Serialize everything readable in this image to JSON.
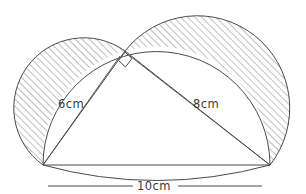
{
  "figure": {
    "type": "geometry-diagram",
    "canvas": {
      "width": 306,
      "height": 194,
      "background": "#ffffff"
    },
    "style": {
      "stroke": "#4a4a4a",
      "hatch_color": "#7a7a7a",
      "hatch_angle_deg": 45,
      "hatch_spacing_px": 5,
      "stroke_width": 1
    },
    "vertices": {
      "A": {
        "name": "bottom-left-vertex",
        "x": 43,
        "y": 165
      },
      "B": {
        "name": "bottom-right-vertex",
        "x": 270,
        "y": 165
      },
      "C": {
        "name": "apex-right-angle-vertex",
        "x": 125,
        "y": 51
      }
    },
    "right_angle_marker": {
      "at": "C",
      "size_px": 11,
      "name": "right-angle-square"
    },
    "labels": {
      "leg_a": {
        "text": "6cm",
        "x": 58,
        "y": 104,
        "rotation": 0
      },
      "leg_b": {
        "text": "8cm",
        "x": 193,
        "y": 104,
        "rotation": 0
      },
      "hypotenuse": {
        "text": "10cm",
        "x": 139,
        "y": 186,
        "rotation": 0
      }
    },
    "measurements": [
      {
        "side": "leg_a",
        "value": 6,
        "unit": "cm",
        "endpoints": [
          "A",
          "C"
        ]
      },
      {
        "side": "leg_b",
        "value": 8,
        "unit": "cm",
        "endpoints": [
          "C",
          "B"
        ]
      },
      {
        "side": "hypotenuse",
        "value": 10,
        "unit": "cm",
        "endpoints": [
          "A",
          "B"
        ]
      }
    ],
    "semicircles": [
      {
        "name": "semicircle-on-leg-a",
        "diameter_endpoints": [
          "A",
          "C"
        ],
        "shaded": true
      },
      {
        "name": "semicircle-on-leg-b",
        "diameter_endpoints": [
          "C",
          "B"
        ],
        "shaded": true
      },
      {
        "name": "semicircle-on-hypotenuse",
        "diameter_endpoints": [
          "A",
          "B"
        ],
        "shaded": false
      }
    ],
    "shaded_regions": [
      {
        "name": "lune-left",
        "description": "region between semicircle on 6cm leg and hypotenuse semicircle"
      },
      {
        "name": "lune-right",
        "description": "region between semicircle on 8cm leg and hypotenuse semicircle"
      }
    ],
    "dimension_line": {
      "name": "hypotenuse-dimension-line",
      "y": 186,
      "x1": 43,
      "x2": 270
    }
  }
}
